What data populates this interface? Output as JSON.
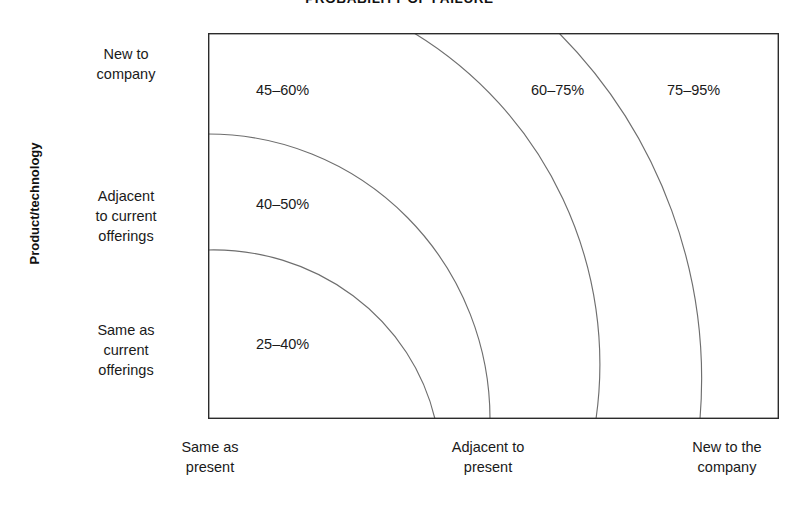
{
  "chart_data": {
    "type": "heatmap",
    "title": "PROBABILITY OF FAILURE",
    "xlabel": "",
    "ylabel": "Product/technology",
    "grid": false,
    "legend": "none",
    "x_categories": [
      "Same as present",
      "Adjacent to present",
      "New to the company"
    ],
    "y_categories": [
      "New to company",
      "Adjacent to current offerings",
      "Same as current offerings"
    ],
    "annotations": [
      {
        "label": "45–60%",
        "x_band": "Same as present",
        "y_band": "New to company",
        "low": 45,
        "high": 60,
        "unit": "%"
      },
      {
        "label": "40–50%",
        "x_band": "Same as present",
        "y_band": "Adjacent to current offerings",
        "low": 40,
        "high": 50,
        "unit": "%"
      },
      {
        "label": "25–40%",
        "x_band": "Same as present",
        "y_band": "Same as current offerings",
        "low": 25,
        "high": 40,
        "unit": "%"
      },
      {
        "label": "60–75%",
        "x_band": "Adjacent to present",
        "y_band": "New to company",
        "low": 60,
        "high": 75,
        "unit": "%"
      },
      {
        "label": "75–95%",
        "x_band": "New to the company",
        "y_band": "New to company",
        "low": 75,
        "high": 95,
        "unit": "%"
      }
    ],
    "bands": [
      {
        "name": "lowest-risk",
        "range": "25–40%"
      },
      {
        "name": "low-risk",
        "range": "40–50%"
      },
      {
        "name": "moderate-risk",
        "range": "45–60%"
      },
      {
        "name": "high-risk",
        "range": "60–75%"
      },
      {
        "name": "highest-risk",
        "range": "75–95%"
      }
    ]
  },
  "title": "PROBABILITY OF FAILURE",
  "axes": {
    "y_title": "Product/technology",
    "y_labels": [
      "New to\ncompany",
      "Adjacent\nto current\nofferings",
      "Same as\ncurrent\nofferings"
    ],
    "x_labels": [
      "Same as\npresent",
      "Adjacent to\npresent",
      "New to the\ncompany"
    ]
  },
  "values": {
    "top_left": "45–60%",
    "middle_left": "40–50%",
    "bottom_left": "25–40%",
    "top_middle": "60–75%",
    "top_right": "75–95%"
  },
  "colors": {
    "background": "#ffffff",
    "border": "#2b2b2b",
    "arc": "#6e6e6e",
    "text": "#1a1a1a"
  }
}
